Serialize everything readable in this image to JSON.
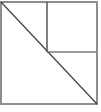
{
  "canvas": {
    "width": 101,
    "height": 112,
    "background": "#ffffff"
  },
  "diagram": {
    "outer_square": {
      "x": 1,
      "y": 2,
      "width": 96,
      "height": 102,
      "stroke": "#8e8e8e",
      "stroke_width": 2,
      "fill": "none"
    },
    "lines": [
      {
        "name": "diagonal-line",
        "x1": 1,
        "y1": 2,
        "x2": 97,
        "y2": 104,
        "stroke": "#3f3f3f",
        "stroke_width": 1.2
      },
      {
        "name": "vertical-divider-line",
        "x1": 47,
        "y1": 2,
        "x2": 47,
        "y2": 52,
        "stroke": "#4a4a4a",
        "stroke_width": 1.4
      },
      {
        "name": "horizontal-divider-line",
        "x1": 47,
        "y1": 52,
        "x2": 97,
        "y2": 52,
        "stroke": "#7a7a7a",
        "stroke_width": 1.6
      }
    ]
  }
}
